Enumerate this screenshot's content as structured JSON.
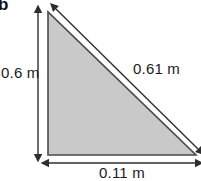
{
  "figure": {
    "part_label": "b",
    "shape": "right-triangle",
    "fill_color": "#c9c9c9",
    "stroke_color": "#4a4a4a",
    "dimension_line_color": "#3a3a3a",
    "background_color": "#ffffff",
    "vertices": {
      "apex_top_left": [
        48,
        12
      ],
      "corner_bottom_left": [
        48,
        155
      ],
      "corner_bottom_right": [
        196,
        155
      ]
    },
    "dimensions": [
      {
        "name": "height",
        "value": "0.6 m",
        "side": "vertical-left",
        "arrow": "double-headed"
      },
      {
        "name": "hypotenuse",
        "value": "0.61 m",
        "side": "diagonal",
        "arrow": "double-headed"
      },
      {
        "name": "base",
        "value": "0.11 m",
        "side": "horizontal-bottom",
        "arrow": "double-headed"
      }
    ]
  }
}
